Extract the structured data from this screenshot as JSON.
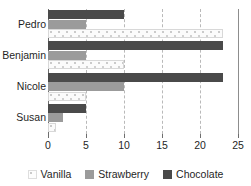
{
  "chart_data": {
    "type": "bar",
    "orientation": "horizontal",
    "title": "",
    "xlabel": "",
    "ylabel": "",
    "categories": [
      "Pedro",
      "Benjamin",
      "Nicole",
      "Susan"
    ],
    "series": [
      {
        "name": "Vanilla",
        "color": "#fbfbfb",
        "values": [
          23,
          10,
          5,
          1
        ]
      },
      {
        "name": "Strawberry",
        "color": "#9b9b9b",
        "values": [
          5,
          5,
          10,
          2
        ]
      },
      {
        "name": "Chocolate",
        "color": "#4a4a4a",
        "values": [
          10,
          23,
          23,
          5
        ]
      }
    ],
    "xlim": [
      0,
      25
    ],
    "xticks": [
      0,
      5,
      10,
      15,
      20,
      25
    ],
    "xtick_labels": [
      "0",
      "5",
      "10",
      "15",
      "20",
      "25"
    ],
    "grid": true,
    "grid_axis": "x",
    "grid_style": "dashed",
    "legend_position": "bottom",
    "bar_order_top_to_bottom": [
      "Chocolate",
      "Strawberry",
      "Vanilla"
    ]
  },
  "axis": {
    "ticks": [
      {
        "value": 0,
        "label": "0"
      },
      {
        "value": 5,
        "label": "5"
      },
      {
        "value": 10,
        "label": "10"
      },
      {
        "value": 15,
        "label": "15"
      },
      {
        "value": 20,
        "label": "20"
      },
      {
        "value": 25,
        "label": "25"
      }
    ]
  },
  "categories": [
    {
      "label": "Pedro"
    },
    {
      "label": "Benjamin"
    },
    {
      "label": "Nicole"
    },
    {
      "label": "Susan"
    }
  ],
  "legend": {
    "items": [
      {
        "label": "Vanilla",
        "swatch": "vanilla"
      },
      {
        "label": "Strawberry",
        "swatch": "strawberry"
      },
      {
        "label": "Chocolate",
        "swatch": "chocolate"
      }
    ]
  }
}
